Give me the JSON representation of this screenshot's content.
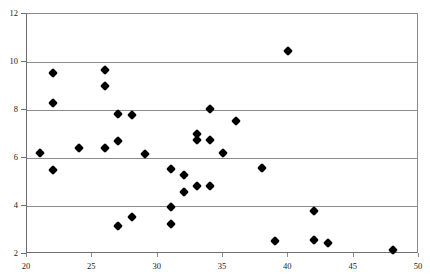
{
  "chart_data": {
    "type": "scatter",
    "title": "",
    "subtitle": "",
    "xlabel": "",
    "ylabel": "",
    "xlim": [
      20,
      50
    ],
    "ylim": [
      2,
      12
    ],
    "xticks": [
      20,
      25,
      30,
      35,
      40,
      45,
      50
    ],
    "yticks": [
      2,
      4,
      6,
      8,
      10,
      12
    ],
    "grid": "horizontal",
    "legend": "none",
    "marker": "filled-diamond",
    "marker_color": "#000000",
    "series": [
      {
        "name": "observations",
        "points": [
          [
            21.0,
            6.2
          ],
          [
            22.0,
            9.55
          ],
          [
            22.0,
            8.3
          ],
          [
            22.0,
            5.5
          ],
          [
            24.0,
            6.4
          ],
          [
            26.0,
            9.65
          ],
          [
            26.0,
            9.0
          ],
          [
            26.0,
            6.4
          ],
          [
            27.0,
            7.85
          ],
          [
            27.0,
            6.7
          ],
          [
            27.0,
            3.15
          ],
          [
            28.0,
            7.8
          ],
          [
            28.0,
            3.55
          ],
          [
            29.0,
            6.15
          ],
          [
            31.0,
            5.55
          ],
          [
            31.0,
            3.95
          ],
          [
            31.0,
            3.25
          ],
          [
            32.0,
            5.3
          ],
          [
            32.0,
            4.6
          ],
          [
            33.0,
            7.0
          ],
          [
            33.0,
            6.75
          ],
          [
            33.0,
            4.85
          ],
          [
            34.0,
            8.05
          ],
          [
            34.0,
            6.75
          ],
          [
            34.0,
            4.85
          ],
          [
            35.0,
            6.2
          ],
          [
            36.0,
            7.55
          ],
          [
            38.0,
            5.6
          ],
          [
            39.0,
            2.55
          ],
          [
            40.0,
            10.45
          ],
          [
            42.0,
            3.8
          ],
          [
            42.0,
            2.6
          ],
          [
            43.0,
            2.45
          ],
          [
            48.0,
            2.15
          ]
        ]
      }
    ]
  },
  "caption": {
    "text": ""
  }
}
